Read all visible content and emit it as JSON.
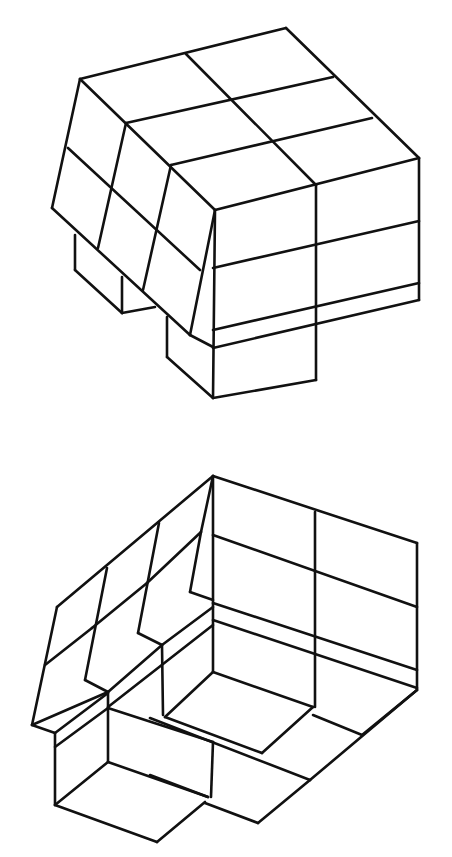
{
  "figure": {
    "background": "#ffffff",
    "stroke_color": "#111111",
    "stroke_width": 2.6,
    "width": 452,
    "height": 857
  },
  "cubes": [
    {
      "name": "cube-top-view",
      "edges": [
        [
          80,
          79,
          286,
          28
        ],
        [
          286,
          28,
          419,
          158
        ],
        [
          419,
          158,
          215,
          210
        ],
        [
          80,
          79,
          215,
          210
        ],
        [
          186,
          54,
          316,
          185
        ],
        [
          126,
          123,
          333,
          77
        ],
        [
          171,
          165,
          372,
          118
        ],
        [
          215,
          210,
          213,
          398
        ],
        [
          316,
          185,
          316,
          380
        ],
        [
          419,
          158,
          419,
          300
        ],
        [
          213,
          268,
          419,
          221
        ],
        [
          213,
          330,
          419,
          283
        ],
        [
          213,
          348,
          419,
          300
        ],
        [
          213,
          398,
          316,
          380
        ],
        [
          80,
          79,
          52,
          208
        ],
        [
          52,
          208,
          190,
          335
        ],
        [
          68,
          148,
          200,
          270
        ],
        [
          126,
          123,
          98,
          248
        ],
        [
          171,
          165,
          143,
          290
        ],
        [
          215,
          210,
          190,
          335
        ],
        [
          190,
          335,
          213,
          347
        ],
        [
          75,
          235,
          75,
          270
        ],
        [
          75,
          270,
          122,
          313
        ],
        [
          122,
          277,
          122,
          313
        ],
        [
          122,
          313,
          155,
          307
        ],
        [
          167,
          317,
          167,
          357
        ],
        [
          167,
          357,
          213,
          398
        ]
      ]
    },
    {
      "name": "cube-bottom-view",
      "edges": [
        [
          213,
          476,
          417,
          543
        ],
        [
          213,
          476,
          57,
          607
        ],
        [
          213,
          476,
          213,
          672
        ],
        [
          315,
          512,
          315,
          707
        ],
        [
          417,
          543,
          417,
          690
        ],
        [
          213,
          535,
          417,
          607
        ],
        [
          213,
          603,
          417,
          670
        ],
        [
          213,
          620,
          417,
          688
        ],
        [
          213,
          476,
          201,
          532
        ],
        [
          201,
          532,
          190,
          592
        ],
        [
          190,
          592,
          213,
          600
        ],
        [
          159,
          523,
          138,
          633
        ],
        [
          107,
          568,
          85,
          680
        ],
        [
          201,
          532,
          147,
          583
        ],
        [
          147,
          583,
          92,
          628
        ],
        [
          92,
          628,
          45,
          665
        ],
        [
          57,
          607,
          32,
          725
        ],
        [
          138,
          633,
          162,
          645
        ],
        [
          162,
          645,
          213,
          607
        ],
        [
          162,
          645,
          163,
          715
        ],
        [
          85,
          680,
          108,
          692
        ],
        [
          108,
          692,
          162,
          645
        ],
        [
          32,
          725,
          108,
          692
        ],
        [
          108,
          707,
          213,
          625
        ],
        [
          32,
          725,
          55,
          733
        ],
        [
          55,
          733,
          108,
          693
        ],
        [
          55,
          733,
          55,
          805
        ],
        [
          55,
          747,
          108,
          708
        ],
        [
          108,
          692,
          108,
          762
        ],
        [
          213,
          672,
          313,
          707
        ],
        [
          213,
          672,
          165,
          717
        ],
        [
          165,
          717,
          262,
          753
        ],
        [
          262,
          753,
          313,
          707
        ],
        [
          313,
          715,
          362,
          735
        ],
        [
          362,
          735,
          417,
          690
        ],
        [
          417,
          690,
          310,
          780
        ],
        [
          150,
          718,
          310,
          780
        ],
        [
          310,
          780,
          258,
          823
        ],
        [
          213,
          742,
          211,
          797
        ],
        [
          108,
          708,
          213,
          742
        ],
        [
          108,
          762,
          208,
          797
        ],
        [
          108,
          762,
          55,
          805
        ],
        [
          150,
          775,
          208,
          797
        ],
        [
          205,
          803,
          258,
          823
        ],
        [
          55,
          805,
          157,
          842
        ],
        [
          157,
          842,
          205,
          802
        ]
      ]
    }
  ]
}
